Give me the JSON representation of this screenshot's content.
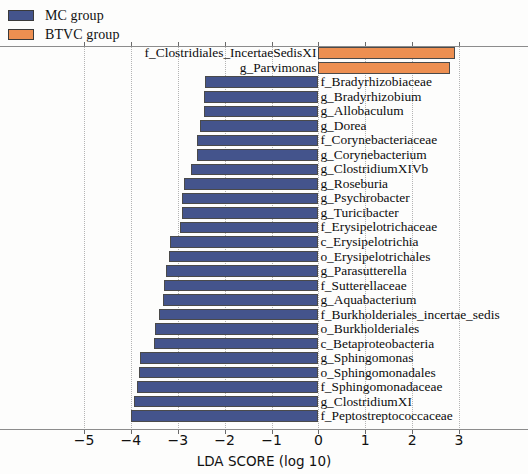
{
  "legend": {
    "items": [
      {
        "label": "MC group",
        "color": "#44548c",
        "key": "mc"
      },
      {
        "label": "BTVC group",
        "color": "#ed8f51",
        "key": "btvc"
      }
    ]
  },
  "axis": {
    "title": "LDA SCORE (log 10)",
    "ticks": [
      "−5",
      "−4",
      "−3",
      "−2",
      "−1",
      "0",
      "1",
      "2",
      "3"
    ],
    "tick_values": [
      -5,
      -4,
      -3,
      -2,
      -1,
      0,
      1,
      2,
      3
    ],
    "xlim": [
      -5.4,
      3.5
    ],
    "grid": "dotted-vertical"
  },
  "chart_data": {
    "type": "bar",
    "orientation": "horizontal",
    "title": "",
    "xlabel": "LDA SCORE (log 10)",
    "ylabel": "",
    "xlim": [
      -5.4,
      3.5
    ],
    "grid": true,
    "legend_position": "top-left",
    "series": [
      {
        "name": "MC group",
        "color": "#44548c"
      },
      {
        "name": "BTVC group",
        "color": "#ed8f51"
      }
    ],
    "categories": [
      "f_Clostridiales_IncertaeSedisXI",
      "g_Parvimonas",
      "f_Bradyrhizobiaceae",
      "g_Bradyrhizobium",
      "g_Allobaculum",
      "g_Dorea",
      "f_Corynebacteriaceae",
      "g_Corynebacterium",
      "g_ClostridiumXIVb",
      "g_Roseburia",
      "g_Psychrobacter",
      "g_Turicibacter",
      "f_Erysipelotrichaceae",
      "c_Erysipelotrichia",
      "o_Erysipelotrichales",
      "g_Parasutterella",
      "f_Sutterellaceae",
      "g_Aquabacterium",
      "f_Burkholderiales_incertae_sedis",
      "o_Burkholderiales",
      "c_Betaproteobacteria",
      "g_Sphingomonas",
      "o_Sphingomonadales",
      "f_Sphingomonadaceae",
      "g_ClostridiumXI",
      "f_Peptostreptococcaceae"
    ],
    "values": [
      2.92,
      2.8,
      -2.41,
      -2.44,
      -2.45,
      -2.52,
      -2.58,
      -2.6,
      -2.72,
      -2.86,
      -2.9,
      -2.91,
      -2.95,
      -3.16,
      -3.18,
      -3.25,
      -3.29,
      -3.32,
      -3.39,
      -3.48,
      -3.5,
      -3.8,
      -3.82,
      -3.86,
      -3.93,
      -4.0
    ],
    "groups": [
      "btvc",
      "btvc",
      "mc",
      "mc",
      "mc",
      "mc",
      "mc",
      "mc",
      "mc",
      "mc",
      "mc",
      "mc",
      "mc",
      "mc",
      "mc",
      "mc",
      "mc",
      "mc",
      "mc",
      "mc",
      "mc",
      "mc",
      "mc",
      "mc",
      "mc",
      "mc"
    ]
  }
}
